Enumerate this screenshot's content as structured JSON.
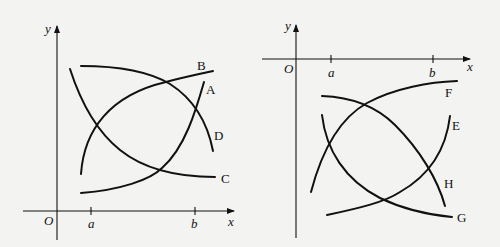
{
  "left_graph": {
    "axes": {
      "x_label": "x",
      "y_label": "y",
      "origin_label": "O",
      "ticks": [
        "a",
        "b"
      ]
    },
    "curves": [
      {
        "label": "A",
        "description": "increasing, concave up"
      },
      {
        "label": "B",
        "description": "increasing, concave down"
      },
      {
        "label": "C",
        "description": "decreasing, concave up"
      },
      {
        "label": "D",
        "description": "decreasing, concave down"
      }
    ]
  },
  "right_graph": {
    "axes": {
      "x_label": "x",
      "y_label": "y",
      "origin_label": "O",
      "ticks": [
        "a",
        "b"
      ]
    },
    "curves": [
      {
        "label": "E",
        "description": "increasing, concave up"
      },
      {
        "label": "F",
        "description": "increasing, concave down"
      },
      {
        "label": "G",
        "description": "decreasing, concave up"
      },
      {
        "label": "H",
        "description": "decreasing, concave down"
      }
    ]
  }
}
